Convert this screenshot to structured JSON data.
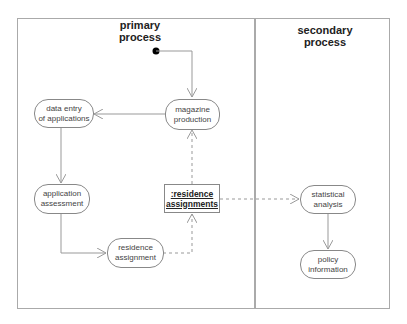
{
  "lanes": [
    {
      "title_line1": "primary",
      "title_line2": "process"
    },
    {
      "title_line1": "secondary",
      "title_line2": "process"
    }
  ],
  "nodes": {
    "data_entry": {
      "line1": "data entry",
      "line2": "of applications"
    },
    "magazine": {
      "line1": "magazine",
      "line2": "production"
    },
    "app_assessment": {
      "line1": "application",
      "line2": "assessment"
    },
    "residence_assignment": {
      "line1": "residence",
      "line2": "assignment"
    },
    "statistical": {
      "line1": "statistical",
      "line2": "analysis"
    },
    "policy": {
      "line1": "policy",
      "line2": "information"
    }
  },
  "object_node": {
    "line1": ":residence",
    "line2": "assignments"
  },
  "colors": {
    "line": "#999999",
    "frame": "#aaaaaa",
    "initial": "#000000"
  }
}
